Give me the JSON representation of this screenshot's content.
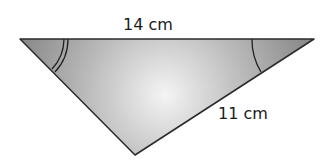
{
  "figure": {
    "type": "triangle",
    "fill_center": "#f2f2f2",
    "fill_edge": "#8f8f8f",
    "stroke": "#2a2a2a",
    "sides": {
      "top": {
        "label": "14 cm"
      },
      "right": {
        "label": "11 cm"
      },
      "left": {
        "label": ""
      }
    },
    "angle_marks": {
      "left_vertex": "double arc",
      "right_vertex": "single arc"
    }
  }
}
